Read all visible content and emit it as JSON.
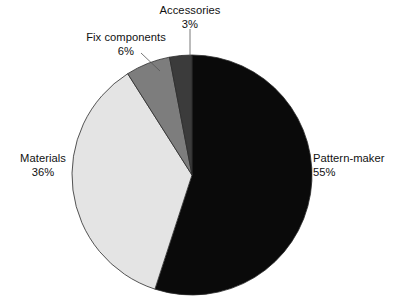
{
  "chart_data": {
    "type": "pie",
    "title": "",
    "subtitle": "",
    "xlabel": "",
    "ylabel": "",
    "legend_position": "none",
    "grid": false,
    "labels_outside": true,
    "start_angle_deg": 0,
    "direction": "clockwise",
    "categories": [
      "Pattern-maker",
      "Materials",
      "Fix components",
      "Accessories"
    ],
    "values": [
      55,
      36,
      6,
      3
    ],
    "value_unit": "%",
    "slices": [
      {
        "name": "Pattern-maker",
        "label": "Pattern-maker",
        "value": 55,
        "value_text": "55%",
        "color": "#0a0a0a",
        "start_deg": 0,
        "end_deg": 198
      },
      {
        "name": "Materials",
        "label": "Materials",
        "value": 36,
        "value_text": "36%",
        "color": "#e4e4e4",
        "start_deg": 198,
        "end_deg": 327.6
      },
      {
        "name": "Fix components",
        "label": "Fix components",
        "value": 6,
        "value_text": "6%",
        "color": "#7d7d7d",
        "start_deg": 327.6,
        "end_deg": 349.2
      },
      {
        "name": "Accessories",
        "label": "Accessories",
        "value": 3,
        "value_text": "3%",
        "color": "#3b3b3b",
        "start_deg": 349.2,
        "end_deg": 360
      }
    ],
    "geometry": {
      "center_x": 192,
      "center_y": 175,
      "radius": 120,
      "stroke": "#2b2b2b",
      "stroke_width": 0.8
    },
    "leaders": [
      {
        "name": "accessories-leader",
        "x1": 190,
        "y1": 29,
        "x2": 190,
        "y2": 56
      },
      {
        "name": "fix-components-leader",
        "x1": 141,
        "y1": 53,
        "x2": 159,
        "y2": 70
      }
    ],
    "background": "#ffffff"
  }
}
